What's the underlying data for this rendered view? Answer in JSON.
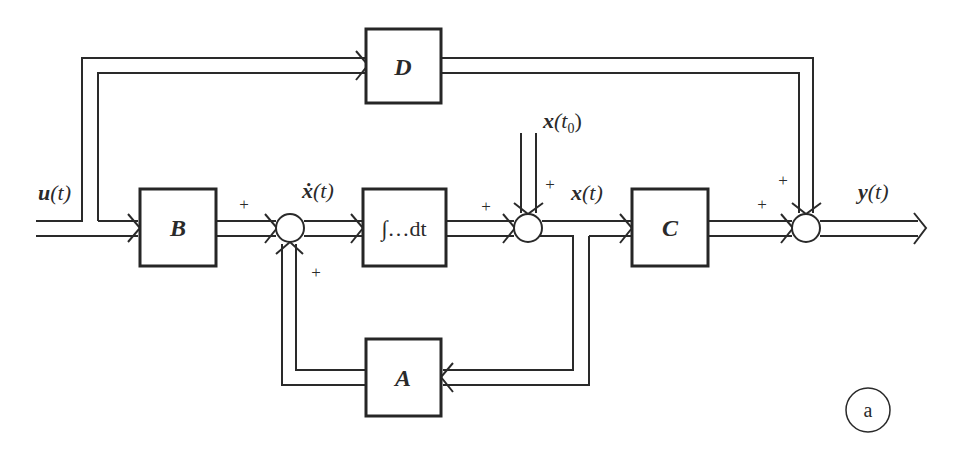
{
  "diagram": {
    "type": "block-diagram",
    "blocks": {
      "B": {
        "label": "B"
      },
      "integrator": {
        "label": "∫…dt"
      },
      "C": {
        "label": "C"
      },
      "D": {
        "label": "D"
      },
      "A": {
        "label": "A"
      }
    },
    "signals": {
      "input": {
        "label_bold": "u",
        "label_rest": "(t)"
      },
      "state_derivative": {
        "label": "ẋ",
        "label_rest": "(t)"
      },
      "initial_state": {
        "label_bold": "x",
        "label_rest": "(t",
        "subscript": "0",
        "close": ")"
      },
      "state": {
        "label_bold": "x",
        "label_rest": "(t)"
      },
      "output": {
        "label_bold": "y",
        "label_rest": "(t)"
      }
    },
    "summing_junctions": [
      {
        "id": "sum1",
        "inputs": [
          "B·u",
          "A·x"
        ],
        "signs": [
          "+",
          "+"
        ]
      },
      {
        "id": "sum2",
        "inputs": [
          "integrator output",
          "x(t0)"
        ],
        "signs": [
          "+",
          "+"
        ]
      },
      {
        "id": "sum3",
        "inputs": [
          "C·x",
          "D·u"
        ],
        "signs": [
          "+",
          "+"
        ]
      }
    ],
    "panel_tag": "a",
    "colors": {
      "ink": "#2a2a2a",
      "background": "#ffffff"
    }
  }
}
